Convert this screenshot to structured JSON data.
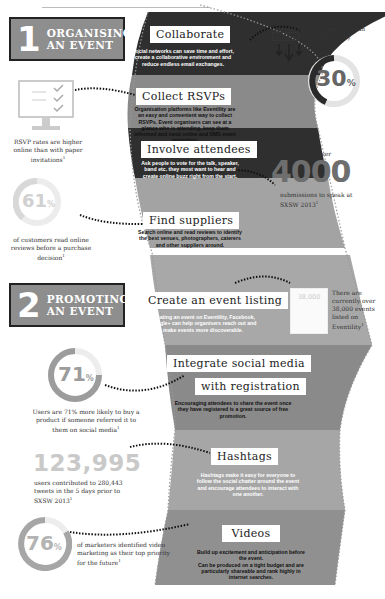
{
  "section1": {
    "number": "1",
    "label_line1": "ORGANISING",
    "label_line2": "AN EVENT",
    "cards": [
      {
        "title": "Collaborate",
        "body": "Social networks can save time and effort, create a collaborative environment and reduce endless email exchanges."
      },
      {
        "title": "Collect RSVPs",
        "body": "Organisation platforms like Eventility are an easy and convenient way to collect RSVPs. Event organisers can see at a glance who is attending, keep them informed and send online and SMS event reminders."
      },
      {
        "title": "Involve attendees",
        "body": "Ask people to vote for the talk, speaker, band etc. they most want to hear and create online buzz right from the start."
      },
      {
        "title": "Find suppliers",
        "body": "Search online and read reviews to identify the best venues, photographers, caterers and other suppliers around."
      }
    ],
    "stats": {
      "email": {
        "text_before": "Internal social networking can",
        "boxed": "reduce",
        "text_after": "email volume by",
        "value": "30",
        "unit": "%",
        "icon": "down-arrows-icon"
      },
      "rsvp": {
        "text": "RSVP rates are higher online than with paper invitations",
        "footnote": "1",
        "icon": "monitor-checklist-icon"
      },
      "reviews": {
        "value": "61",
        "unit": "%",
        "text": "of customers read online reviews before a purchase decision",
        "footnote": "1"
      },
      "sxsw_submissions": {
        "text_before": "There were over",
        "value": "4000",
        "text_after": "submissions to speak at SXSW 2013",
        "footnote": "1"
      }
    }
  },
  "section2": {
    "number": "2",
    "label_line1": "PROMOTING",
    "label_line2": "AN EVENT",
    "cards": [
      {
        "title": "Create an event listing",
        "body": "Creating an event on Eventility, Facebook, Google+ can help organisers reach out and make events more discoverable."
      },
      {
        "title_line1": "Integrate social media",
        "title_line2": "with registration",
        "body": "Encouraging attendees to share the event once they have registered is a great source of free promotion."
      },
      {
        "title": "Hashtags",
        "body": "Hashtags make it easy for everyone to follow the social chatter around the event and encourage attendees to interact with one another."
      },
      {
        "title": "Videos",
        "body_line1": "Build up excitement and anticipation before the event.",
        "body_line2": "Can be produced on a tight budget and are particularly shareable and rank highly in internet searches."
      }
    ],
    "stats": {
      "listings": {
        "badge": "38,000",
        "text": "There are currently over 38,000 events listed on Eventility",
        "footnote": "1"
      },
      "referrals": {
        "value": "71",
        "unit": "%",
        "text": "Users are 71% more likely to buy a product if someone referred it to them on social media",
        "footnote": "1"
      },
      "tweets": {
        "value": "123,995",
        "text": "users contributed to 280,443 tweets in the 5 days prior to SXSW 2013",
        "footnote": "1"
      },
      "video": {
        "value": "76",
        "unit": "%",
        "text": "of marketers identified video marketing as their top priority for the future",
        "footnote": "1"
      }
    }
  },
  "colors": {
    "dark_band": "#2f2f2f",
    "mid_band": "#8a8a8a",
    "light_band": "#b5b5b5",
    "ring_light": "#e3e3e3",
    "ring_dark": "#2a2a2a",
    "badge_bg": "#8e8e8e"
  }
}
